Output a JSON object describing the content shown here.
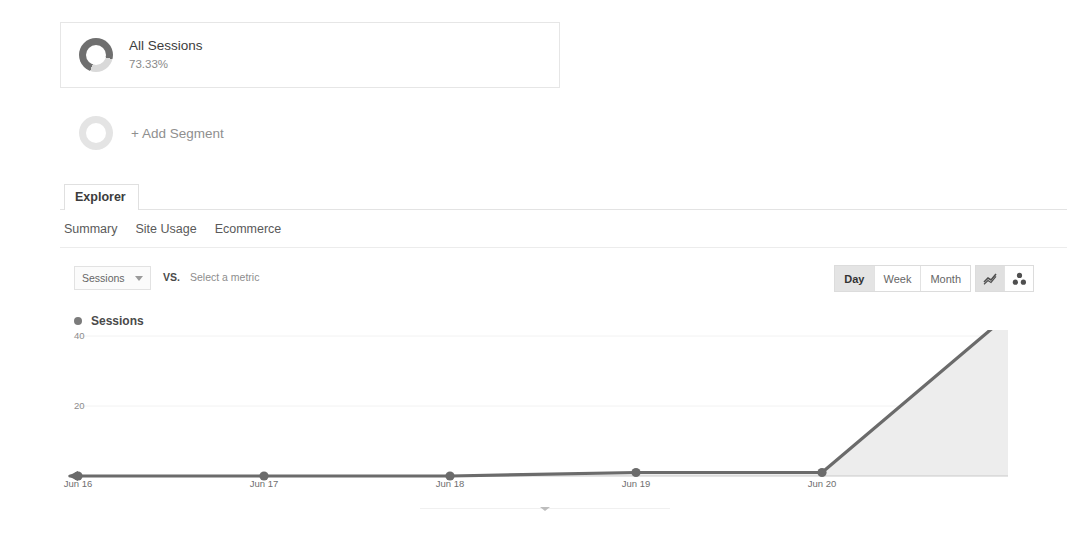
{
  "segments": {
    "active": {
      "name": "All Sessions",
      "percent": "73.33%",
      "donut_fill_percent": 73.33,
      "icon": "donut-ring-icon"
    },
    "add": {
      "label": "+ Add Segment",
      "icon": "empty-ring-icon"
    }
  },
  "tabs": {
    "main": [
      {
        "label": "Explorer",
        "active": true
      }
    ],
    "sub": [
      {
        "label": "Summary",
        "active": true
      },
      {
        "label": "Site Usage",
        "active": false
      },
      {
        "label": "Ecommerce",
        "active": false
      }
    ]
  },
  "controls": {
    "metric_select": {
      "value": "Sessions",
      "caret_icon": "chevron-down-icon"
    },
    "vs_label": "VS.",
    "compare_metric_placeholder": "Select a metric",
    "granularity": {
      "options": [
        "Day",
        "Week",
        "Month"
      ],
      "selected": "Day"
    },
    "chart_type": {
      "options": [
        {
          "name": "line-chart-icon",
          "active": true
        },
        {
          "name": "motion-chart-icon",
          "active": false
        }
      ]
    }
  },
  "legend": {
    "marker_color": "#7b7b7b",
    "label": "Sessions"
  },
  "bottom_handle": {
    "icon": "chevron-down-icon"
  },
  "colors": {
    "line": "#6b6b6b",
    "area_fill": "#ededed",
    "axis": "#c9c9c9",
    "grid": "#f2f2f2",
    "text": "#6f6f6f"
  },
  "chart_data": {
    "type": "line",
    "title": "Sessions",
    "xlabel": "",
    "ylabel": "Sessions",
    "categories": [
      "Jun 16",
      "Jun 17",
      "Jun 18",
      "Jun 19",
      "Jun 20",
      ""
    ],
    "x": [
      "Jun 16",
      "Jun 17",
      "Jun 18",
      "Jun 19",
      "Jun 20",
      ""
    ],
    "series": [
      {
        "name": "Sessions",
        "values": [
          0,
          0,
          0,
          1,
          1,
          46
        ]
      }
    ],
    "values": [
      0,
      0,
      0,
      1,
      1,
      46
    ],
    "ylim": [
      0,
      46
    ],
    "yticks": [
      20,
      40
    ],
    "ytick_labels": [
      "20",
      "40"
    ],
    "grid": true,
    "area_filled": true,
    "markers": [
      true,
      true,
      true,
      true,
      true,
      false
    ],
    "legend_position": "top-left"
  }
}
